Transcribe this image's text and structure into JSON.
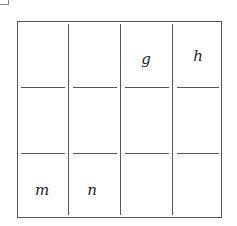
{
  "diagram": {
    "rows": 3,
    "cols": 4,
    "cells": [
      [
        "",
        "",
        "g",
        "h"
      ],
      [
        "",
        "",
        "",
        ""
      ],
      [
        "m",
        "n",
        "",
        ""
      ]
    ],
    "labels": {
      "g": "g",
      "h": "h",
      "m": "m",
      "n": "n"
    }
  }
}
